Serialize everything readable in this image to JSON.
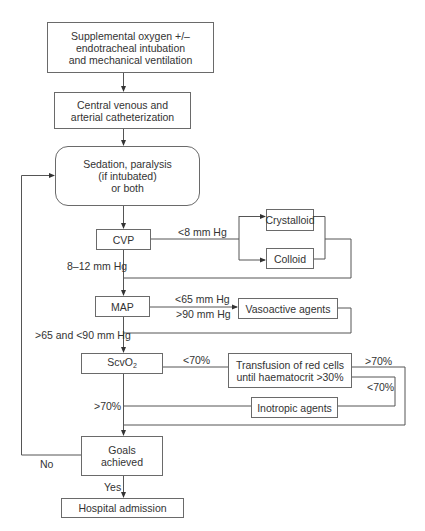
{
  "flowchart": {
    "nodes": {
      "oxygen": {
        "lines": [
          "Supplemental oxygen +/–",
          "endotracheal intubation",
          "and mechanical ventilation"
        ]
      },
      "catheter": {
        "lines": [
          "Central venous and",
          "arterial catheterization"
        ]
      },
      "sedation": {
        "lines": [
          "Sedation, paralysis",
          "(if intubated)",
          "or both"
        ]
      },
      "cvp": {
        "label": "CVP"
      },
      "crystalloid": {
        "label": "Crystalloid"
      },
      "colloid": {
        "label": "Colloid"
      },
      "map": {
        "label": "MAP"
      },
      "vasoactive": {
        "label": "Vasoactive agents"
      },
      "scvo2": {
        "label": "ScvO",
        "sub": "2"
      },
      "transfusion": {
        "lines": [
          "Transfusion of red cells",
          "until haematocrit >30%"
        ]
      },
      "inotropic": {
        "label": "Inotropic agents"
      },
      "goals": {
        "lines": [
          "Goals",
          "achieved"
        ]
      },
      "hospital": {
        "label": "Hospital admission"
      }
    },
    "edge_labels": {
      "cvp_low": "<8 mm Hg",
      "cvp_ok": "8–12 mm Hg",
      "map_low": "<65 mm Hg",
      "map_high": ">90 mm Hg",
      "map_ok": ">65 and <90 mm Hg",
      "scvo2_low": "<70%",
      "scvo2_ok": ">70%",
      "transfusion_ok": ">70%",
      "transfusion_low": "<70%",
      "goals_no": "No",
      "goals_yes": "Yes"
    },
    "colors": {
      "line": "#555555",
      "text": "#333333",
      "background": "#ffffff"
    }
  }
}
